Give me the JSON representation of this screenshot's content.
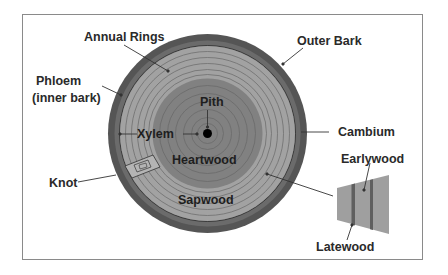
{
  "diagram": {
    "colors": {
      "outer_bark": "#555555",
      "phloem": "#6b6b6b",
      "sapwood": "#a2a2a2",
      "heartwood": "#818181",
      "ring_line": "#5a5a5a",
      "pith": "#000000",
      "wedge": "#9f9f9f",
      "latewood_band": "#5f5f5f",
      "frame_border": "#8a8a8a",
      "text": "#2a2a2a"
    },
    "labels": {
      "annual_rings": "Annual Rings",
      "outer_bark": "Outer Bark",
      "phloem_line1": "Phloem",
      "phloem_line2": "(inner bark)",
      "pith": "Pith",
      "xylem": "Xylem",
      "cambium": "Cambium",
      "heartwood": "Heartwood",
      "knot": "Knot",
      "sapwood": "Sapwood",
      "earlywood": "Earlywood",
      "latewood": "Latewood"
    }
  }
}
